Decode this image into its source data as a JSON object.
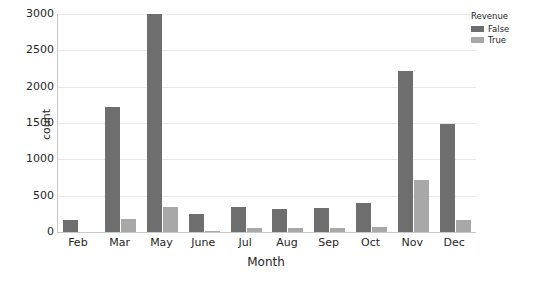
{
  "chart_data": {
    "type": "bar",
    "title": "",
    "xlabel": "Month",
    "ylabel": "count",
    "categories": [
      "Feb",
      "Mar",
      "May",
      "June",
      "Jul",
      "Aug",
      "Sep",
      "Oct",
      "Nov",
      "Dec"
    ],
    "series": [
      {
        "name": "False",
        "color": "#6e6e6e",
        "values": [
          170,
          1720,
          3000,
          250,
          340,
          320,
          330,
          400,
          2210,
          1480
        ]
      },
      {
        "name": "True",
        "color": "#a8a8a8",
        "values": [
          0,
          180,
          340,
          20,
          55,
          60,
          60,
          75,
          720,
          170
        ]
      }
    ],
    "ylim": [
      0,
      3000
    ],
    "yticks": [
      0,
      500,
      1000,
      1500,
      2000,
      2500,
      3000
    ],
    "ytick_labels": [
      "0",
      "500",
      "1000",
      "1500",
      "2000",
      "2500",
      "3000"
    ],
    "grid": true,
    "legend": {
      "title": "Revenue",
      "position": "upper right",
      "entries": [
        {
          "label": "False",
          "color": "#6e6e6e"
        },
        {
          "label": "True",
          "color": "#a8a8a8"
        }
      ]
    },
    "background": "#ffffff",
    "axis_color": "#c8c8c8",
    "grid_color": "#e8e8e8"
  }
}
